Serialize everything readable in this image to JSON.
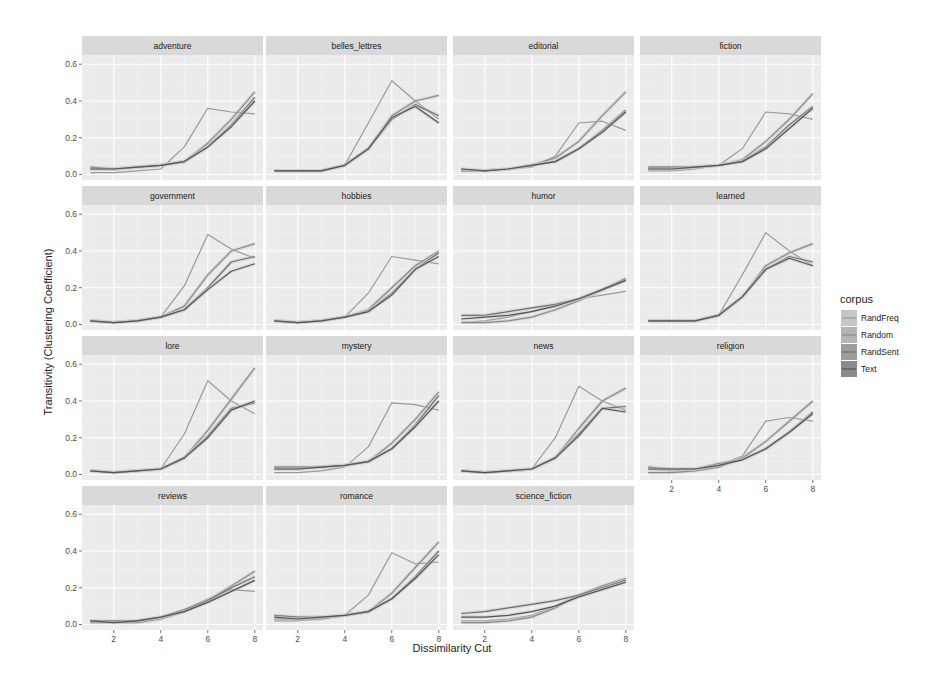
{
  "chart_data": {
    "type": "line",
    "title": "",
    "xlabel": "Dissimilarity Cut",
    "ylabel": "Transitivity (Clustering Coefficient)",
    "x": [
      1,
      2,
      3,
      4,
      5,
      6,
      7,
      8
    ],
    "xticks": [
      2,
      4,
      6,
      8
    ],
    "ylim": [
      0,
      0.65
    ],
    "yticks": [
      0.0,
      0.2,
      0.4,
      0.6
    ],
    "ytick_labels": [
      "0.0",
      "0.2",
      "0.4",
      "0.6"
    ],
    "grid": true,
    "legend": {
      "title": "corpus",
      "position": "right",
      "entries": [
        "RandFreq",
        "Random",
        "RandSent",
        "Text"
      ]
    },
    "series_colors": {
      "RandFreq": "#9a9a9a",
      "Random": "#8a8a8a",
      "RandSent": "#6e6e6e",
      "Text": "#555555"
    },
    "facets": [
      {
        "name": "adventure",
        "series": [
          {
            "name": "RandFreq",
            "values": [
              0.01,
              0.01,
              0.02,
              0.03,
              0.15,
              0.36,
              0.34,
              0.33
            ]
          },
          {
            "name": "Random",
            "values": [
              0.03,
              0.03,
              0.04,
              0.05,
              0.07,
              0.17,
              0.3,
              0.45
            ]
          },
          {
            "name": "RandSent",
            "values": [
              0.04,
              0.03,
              0.04,
              0.05,
              0.07,
              0.15,
              0.27,
              0.42
            ]
          },
          {
            "name": "Text",
            "values": [
              0.03,
              0.03,
              0.04,
              0.05,
              0.07,
              0.15,
              0.26,
              0.4
            ]
          }
        ]
      },
      {
        "name": "belles_lettres",
        "series": [
          {
            "name": "RandFreq",
            "values": [
              0.02,
              0.02,
              0.02,
              0.05,
              0.28,
              0.51,
              0.4,
              0.3
            ]
          },
          {
            "name": "Random",
            "values": [
              0.02,
              0.02,
              0.02,
              0.05,
              0.14,
              0.32,
              0.4,
              0.43
            ]
          },
          {
            "name": "RandSent",
            "values": [
              0.02,
              0.02,
              0.02,
              0.05,
              0.14,
              0.3,
              0.38,
              0.32
            ]
          },
          {
            "name": "Text",
            "values": [
              0.02,
              0.02,
              0.02,
              0.05,
              0.14,
              0.31,
              0.37,
              0.28
            ]
          }
        ]
      },
      {
        "name": "editorial",
        "series": [
          {
            "name": "RandFreq",
            "values": [
              0.02,
              0.02,
              0.03,
              0.04,
              0.1,
              0.28,
              0.29,
              0.24
            ]
          },
          {
            "name": "Random",
            "values": [
              0.02,
              0.02,
              0.03,
              0.05,
              0.09,
              0.18,
              0.32,
              0.45
            ]
          },
          {
            "name": "RandSent",
            "values": [
              0.03,
              0.02,
              0.03,
              0.05,
              0.07,
              0.14,
              0.24,
              0.35
            ]
          },
          {
            "name": "Text",
            "values": [
              0.03,
              0.02,
              0.03,
              0.05,
              0.07,
              0.14,
              0.23,
              0.34
            ]
          }
        ]
      },
      {
        "name": "fiction",
        "series": [
          {
            "name": "RandFreq",
            "values": [
              0.02,
              0.02,
              0.03,
              0.05,
              0.14,
              0.34,
              0.33,
              0.3
            ]
          },
          {
            "name": "Random",
            "values": [
              0.03,
              0.03,
              0.04,
              0.05,
              0.08,
              0.18,
              0.3,
              0.44
            ]
          },
          {
            "name": "RandSent",
            "values": [
              0.04,
              0.04,
              0.04,
              0.05,
              0.07,
              0.15,
              0.27,
              0.37
            ]
          },
          {
            "name": "Text",
            "values": [
              0.03,
              0.03,
              0.04,
              0.05,
              0.07,
              0.14,
              0.25,
              0.36
            ]
          }
        ]
      },
      {
        "name": "government",
        "series": [
          {
            "name": "RandFreq",
            "values": [
              0.02,
              0.01,
              0.02,
              0.04,
              0.21,
              0.49,
              0.41,
              0.36
            ]
          },
          {
            "name": "Random",
            "values": [
              0.02,
              0.01,
              0.02,
              0.04,
              0.1,
              0.27,
              0.4,
              0.44
            ]
          },
          {
            "name": "RandSent",
            "values": [
              0.02,
              0.01,
              0.02,
              0.04,
              0.08,
              0.2,
              0.34,
              0.37
            ]
          },
          {
            "name": "Text",
            "values": [
              0.02,
              0.01,
              0.02,
              0.04,
              0.08,
              0.19,
              0.29,
              0.33
            ]
          }
        ]
      },
      {
        "name": "hobbies",
        "series": [
          {
            "name": "RandFreq",
            "values": [
              0.02,
              0.01,
              0.02,
              0.04,
              0.17,
              0.37,
              0.35,
              0.33
            ]
          },
          {
            "name": "Random",
            "values": [
              0.02,
              0.01,
              0.02,
              0.04,
              0.08,
              0.2,
              0.32,
              0.4
            ]
          },
          {
            "name": "RandSent",
            "values": [
              0.02,
              0.01,
              0.02,
              0.04,
              0.07,
              0.17,
              0.3,
              0.39
            ]
          },
          {
            "name": "Text",
            "values": [
              0.02,
              0.01,
              0.02,
              0.04,
              0.07,
              0.16,
              0.3,
              0.37
            ]
          }
        ]
      },
      {
        "name": "humor",
        "series": [
          {
            "name": "RandFreq",
            "values": [
              0.01,
              0.02,
              0.04,
              0.07,
              0.11,
              0.14,
              0.16,
              0.18
            ]
          },
          {
            "name": "Random",
            "values": [
              0.01,
              0.01,
              0.02,
              0.04,
              0.08,
              0.13,
              0.19,
              0.24
            ]
          },
          {
            "name": "RandSent",
            "values": [
              0.05,
              0.05,
              0.07,
              0.09,
              0.11,
              0.14,
              0.19,
              0.25
            ]
          },
          {
            "name": "Text",
            "values": [
              0.03,
              0.04,
              0.05,
              0.07,
              0.1,
              0.14,
              0.19,
              0.24
            ]
          }
        ]
      },
      {
        "name": "learned",
        "series": [
          {
            "name": "RandFreq",
            "values": [
              0.02,
              0.02,
              0.02,
              0.05,
              0.27,
              0.5,
              0.4,
              0.32
            ]
          },
          {
            "name": "Random",
            "values": [
              0.02,
              0.02,
              0.02,
              0.05,
              0.15,
              0.32,
              0.39,
              0.44
            ]
          },
          {
            "name": "RandSent",
            "values": [
              0.02,
              0.02,
              0.02,
              0.05,
              0.15,
              0.3,
              0.37,
              0.34
            ]
          },
          {
            "name": "Text",
            "values": [
              0.02,
              0.02,
              0.02,
              0.05,
              0.15,
              0.3,
              0.36,
              0.32
            ]
          }
        ]
      },
      {
        "name": "lore",
        "series": [
          {
            "name": "RandFreq",
            "values": [
              0.02,
              0.01,
              0.02,
              0.03,
              0.22,
              0.51,
              0.4,
              0.33
            ]
          },
          {
            "name": "Random",
            "values": [
              0.02,
              0.01,
              0.02,
              0.03,
              0.09,
              0.24,
              0.41,
              0.58
            ]
          },
          {
            "name": "RandSent",
            "values": [
              0.02,
              0.01,
              0.02,
              0.03,
              0.09,
              0.21,
              0.36,
              0.39
            ]
          },
          {
            "name": "Text",
            "values": [
              0.02,
              0.01,
              0.02,
              0.03,
              0.09,
              0.2,
              0.35,
              0.4
            ]
          }
        ]
      },
      {
        "name": "mystery",
        "series": [
          {
            "name": "RandFreq",
            "values": [
              0.01,
              0.01,
              0.02,
              0.04,
              0.15,
              0.39,
              0.38,
              0.35
            ]
          },
          {
            "name": "Random",
            "values": [
              0.03,
              0.03,
              0.04,
              0.05,
              0.07,
              0.17,
              0.3,
              0.45
            ]
          },
          {
            "name": "RandSent",
            "values": [
              0.04,
              0.04,
              0.04,
              0.05,
              0.07,
              0.14,
              0.27,
              0.43
            ]
          },
          {
            "name": "Text",
            "values": [
              0.03,
              0.03,
              0.04,
              0.05,
              0.07,
              0.14,
              0.26,
              0.4
            ]
          }
        ]
      },
      {
        "name": "news",
        "series": [
          {
            "name": "RandFreq",
            "values": [
              0.02,
              0.01,
              0.02,
              0.03,
              0.2,
              0.48,
              0.4,
              0.35
            ]
          },
          {
            "name": "Random",
            "values": [
              0.02,
              0.01,
              0.02,
              0.03,
              0.09,
              0.25,
              0.4,
              0.47
            ]
          },
          {
            "name": "RandSent",
            "values": [
              0.02,
              0.01,
              0.02,
              0.03,
              0.09,
              0.22,
              0.36,
              0.37
            ]
          },
          {
            "name": "Text",
            "values": [
              0.02,
              0.01,
              0.02,
              0.03,
              0.09,
              0.21,
              0.36,
              0.34
            ]
          }
        ]
      },
      {
        "name": "religion",
        "series": [
          {
            "name": "RandFreq",
            "values": [
              0.03,
              0.02,
              0.03,
              0.05,
              0.1,
              0.29,
              0.31,
              0.29
            ]
          },
          {
            "name": "Random",
            "values": [
              0.01,
              0.01,
              0.02,
              0.04,
              0.09,
              0.18,
              0.29,
              0.4
            ]
          },
          {
            "name": "RandSent",
            "values": [
              0.04,
              0.03,
              0.03,
              0.06,
              0.08,
              0.14,
              0.23,
              0.34
            ]
          },
          {
            "name": "Text",
            "values": [
              0.03,
              0.03,
              0.03,
              0.05,
              0.08,
              0.14,
              0.23,
              0.33
            ]
          }
        ]
      },
      {
        "name": "reviews",
        "series": [
          {
            "name": "RandFreq",
            "values": [
              0.02,
              0.01,
              0.02,
              0.04,
              0.08,
              0.14,
              0.19,
              0.18
            ]
          },
          {
            "name": "Random",
            "values": [
              0.01,
              0.01,
              0.01,
              0.03,
              0.07,
              0.13,
              0.21,
              0.29
            ]
          },
          {
            "name": "RandSent",
            "values": [
              0.02,
              0.02,
              0.02,
              0.04,
              0.08,
              0.13,
              0.2,
              0.26
            ]
          },
          {
            "name": "Text",
            "values": [
              0.02,
              0.01,
              0.02,
              0.04,
              0.07,
              0.12,
              0.18,
              0.24
            ]
          }
        ]
      },
      {
        "name": "romance",
        "series": [
          {
            "name": "RandFreq",
            "values": [
              0.02,
              0.02,
              0.03,
              0.05,
              0.16,
              0.39,
              0.33,
              0.34
            ]
          },
          {
            "name": "Random",
            "values": [
              0.03,
              0.03,
              0.03,
              0.05,
              0.07,
              0.17,
              0.31,
              0.45
            ]
          },
          {
            "name": "RandSent",
            "values": [
              0.05,
              0.04,
              0.04,
              0.05,
              0.07,
              0.14,
              0.26,
              0.4
            ]
          },
          {
            "name": "Text",
            "values": [
              0.04,
              0.03,
              0.04,
              0.05,
              0.07,
              0.14,
              0.25,
              0.38
            ]
          }
        ]
      },
      {
        "name": "science_fiction",
        "series": [
          {
            "name": "RandFreq",
            "values": [
              0.02,
              0.02,
              0.03,
              0.05,
              0.1,
              0.16,
              0.2,
              0.23
            ]
          },
          {
            "name": "Random",
            "values": [
              0.01,
              0.01,
              0.02,
              0.04,
              0.09,
              0.16,
              0.21,
              0.25
            ]
          },
          {
            "name": "RandSent",
            "values": [
              0.06,
              0.07,
              0.09,
              0.11,
              0.13,
              0.16,
              0.2,
              0.24
            ]
          },
          {
            "name": "Text",
            "values": [
              0.04,
              0.04,
              0.05,
              0.07,
              0.1,
              0.15,
              0.19,
              0.23
            ]
          }
        ]
      }
    ]
  },
  "layout": {
    "cols": 4,
    "col_x": [
      82,
      266,
      453,
      640
    ],
    "panel_w": 181,
    "row_strip_y": [
      36,
      186,
      336,
      486
    ],
    "strip_h": 19,
    "plot_h": 125,
    "x_range": [
      0.65,
      8.35
    ],
    "y_range": [
      -0.03,
      0.65
    ]
  }
}
